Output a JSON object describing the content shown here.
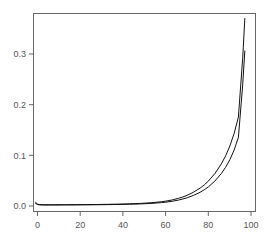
{
  "chart_data": {
    "type": "line",
    "title": "",
    "subtitle": "",
    "xlabel": "",
    "ylabel": "",
    "xlim": [
      0,
      104
    ],
    "ylim": [
      -0.012,
      0.385
    ],
    "grid": false,
    "legend": null,
    "background_color": "#ffffff",
    "frame_color": "#666666",
    "line_color": "#111111",
    "x_ticks": [
      0,
      20,
      40,
      60,
      80,
      100
    ],
    "x_tick_labels": [
      "0",
      "20",
      "40",
      "60",
      "80",
      "100"
    ],
    "y_ticks": [
      0.0,
      0.1,
      0.2,
      0.3
    ],
    "y_tick_labels": [
      "0.0",
      "0.1",
      "0.2",
      "0.3"
    ],
    "x": [
      1,
      2,
      3,
      5,
      10,
      15,
      20,
      25,
      30,
      35,
      40,
      45,
      50,
      55,
      60,
      62,
      65,
      68,
      70,
      72,
      75,
      78,
      80,
      82,
      85,
      88,
      90,
      92,
      94,
      96,
      98,
      99
    ],
    "series": [
      {
        "name": "upper-curve",
        "values": [
          0.006,
          0.0025,
          0.0018,
          0.0015,
          0.0015,
          0.0016,
          0.0017,
          0.0019,
          0.0021,
          0.0024,
          0.0028,
          0.0034,
          0.0042,
          0.0055,
          0.0076,
          0.0088,
          0.0112,
          0.0145,
          0.0172,
          0.0205,
          0.0268,
          0.0348,
          0.0414,
          0.0492,
          0.0642,
          0.0835,
          0.0995,
          0.1195,
          0.1445,
          0.1775,
          0.2955,
          0.375
        ]
      },
      {
        "name": "lower-curve",
        "values": [
          0.004,
          0.0018,
          0.0013,
          0.0011,
          0.0011,
          0.0012,
          0.0013,
          0.0014,
          0.0016,
          0.0018,
          0.0021,
          0.0026,
          0.0032,
          0.0042,
          0.0058,
          0.0067,
          0.0085,
          0.011,
          0.0131,
          0.0156,
          0.0204,
          0.0265,
          0.0316,
          0.0376,
          0.0492,
          0.0642,
          0.0766,
          0.092,
          0.1113,
          0.1368,
          0.242,
          0.31
        ]
      }
    ]
  }
}
